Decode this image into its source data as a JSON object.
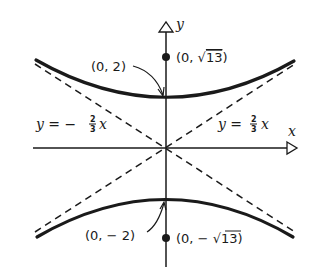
{
  "diagram": {
    "type": "hyperbola",
    "equation_implied": "y^2/4 - x^2/9 = 1",
    "axes": {
      "x_label": "x",
      "y_label": "y"
    },
    "vertices": [
      {
        "label": "(0, 2)",
        "x": 0,
        "y": 2
      },
      {
        "label": "(0, − 2)",
        "x": 0,
        "y": -2
      }
    ],
    "foci": [
      {
        "label_prefix": "(0, ",
        "label_root": "13",
        "label_suffix": ")",
        "sign": "",
        "x": 0,
        "y": 3.606
      },
      {
        "label_prefix": "(0, − ",
        "label_root": "13",
        "label_suffix": ")",
        "sign": "−",
        "x": 0,
        "y": -3.606
      }
    ],
    "asymptotes": [
      {
        "label_lhs": "y = − ",
        "num": "2",
        "den": "3",
        "var": "x",
        "slope": -0.6667
      },
      {
        "label_lhs": "y = ",
        "num": "2",
        "den": "3",
        "var": "x",
        "slope": 0.6667
      }
    ],
    "colors": {
      "stroke": "#1a1a1a",
      "background": "#ffffff"
    }
  }
}
